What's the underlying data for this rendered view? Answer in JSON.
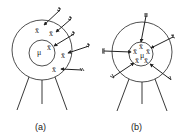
{
  "diagram": {
    "panels": [
      {
        "id": "a",
        "label": "(a)",
        "center_symbol": "μ",
        "sample_symbol": "x̄",
        "sample_count": 5,
        "arrow_count": 5
      },
      {
        "id": "b",
        "label": "(b)",
        "center_symbol": "μ",
        "sample_symbol": "x̄",
        "sample_count": 5,
        "arrow_count": 6
      }
    ],
    "colors": {
      "stroke": "#222222",
      "background": "#ffffff"
    }
  }
}
